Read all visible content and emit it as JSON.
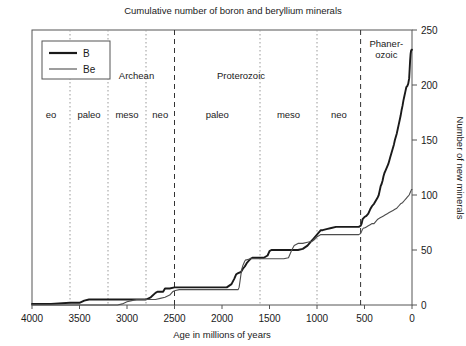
{
  "chart_data": {
    "type": "line",
    "title": "Cumulative number of boron and beryllium minerals",
    "xlabel": "Age in millions of years",
    "ylabel": "Number of new minerals",
    "xlim": [
      4000,
      0
    ],
    "ylim": [
      0,
      250
    ],
    "xticks": [
      4000,
      3500,
      3000,
      2500,
      2000,
      1500,
      1000,
      500,
      0
    ],
    "yticks": [
      0,
      50,
      100,
      150,
      200,
      250
    ],
    "xtick_labels": [
      "4000",
      "3500",
      "3000",
      "2500",
      "2000",
      "1500",
      "1000",
      "500",
      "0"
    ],
    "ytick_labels": [
      "0",
      "50",
      "100",
      "150",
      "200",
      "250"
    ],
    "x_axis_reversed": true,
    "grid": false,
    "legend_position": "top-left",
    "series": [
      {
        "name": "B",
        "color": "#1a1a1a",
        "width": 1.9,
        "points": [
          [
            4000,
            1
          ],
          [
            3800,
            1
          ],
          [
            3600,
            2
          ],
          [
            3500,
            2
          ],
          [
            3450,
            4
          ],
          [
            3400,
            5
          ],
          [
            3300,
            5
          ],
          [
            3200,
            5
          ],
          [
            3100,
            5
          ],
          [
            3000,
            5
          ],
          [
            2850,
            5
          ],
          [
            2800,
            5
          ],
          [
            2750,
            7
          ],
          [
            2700,
            11
          ],
          [
            2680,
            12
          ],
          [
            2620,
            12
          ],
          [
            2600,
            15
          ],
          [
            2550,
            15
          ],
          [
            2500,
            16
          ],
          [
            2400,
            16
          ],
          [
            2300,
            16
          ],
          [
            2200,
            16
          ],
          [
            2100,
            16
          ],
          [
            2000,
            16
          ],
          [
            1950,
            16
          ],
          [
            1900,
            19
          ],
          [
            1870,
            24
          ],
          [
            1850,
            28
          ],
          [
            1830,
            29
          ],
          [
            1800,
            30
          ],
          [
            1780,
            33
          ],
          [
            1760,
            35
          ],
          [
            1740,
            38
          ],
          [
            1720,
            40
          ],
          [
            1700,
            42
          ],
          [
            1680,
            43
          ],
          [
            1660,
            43
          ],
          [
            1640,
            43
          ],
          [
            1620,
            43
          ],
          [
            1600,
            43
          ],
          [
            1560,
            43
          ],
          [
            1520,
            45
          ],
          [
            1500,
            49
          ],
          [
            1480,
            50
          ],
          [
            1450,
            50
          ],
          [
            1400,
            50
          ],
          [
            1350,
            50
          ],
          [
            1300,
            50
          ],
          [
            1250,
            50
          ],
          [
            1200,
            50
          ],
          [
            1150,
            51
          ],
          [
            1100,
            54
          ],
          [
            1080,
            56
          ],
          [
            1060,
            58
          ],
          [
            1040,
            60
          ],
          [
            1020,
            62
          ],
          [
            1000,
            64
          ],
          [
            980,
            66
          ],
          [
            960,
            68
          ],
          [
            940,
            68
          ],
          [
            900,
            69
          ],
          [
            850,
            70
          ],
          [
            800,
            71
          ],
          [
            750,
            71
          ],
          [
            700,
            71
          ],
          [
            650,
            71
          ],
          [
            600,
            71
          ],
          [
            560,
            71
          ],
          [
            541,
            72
          ],
          [
            530,
            74
          ],
          [
            520,
            78
          ],
          [
            510,
            79
          ],
          [
            500,
            80
          ],
          [
            480,
            81
          ],
          [
            460,
            83
          ],
          [
            440,
            87
          ],
          [
            420,
            90
          ],
          [
            400,
            92
          ],
          [
            380,
            95
          ],
          [
            360,
            98
          ],
          [
            350,
            100
          ],
          [
            340,
            104
          ],
          [
            330,
            108
          ],
          [
            320,
            110
          ],
          [
            310,
            113
          ],
          [
            300,
            117
          ],
          [
            290,
            120
          ],
          [
            280,
            122
          ],
          [
            270,
            124
          ],
          [
            260,
            126
          ],
          [
            250,
            128
          ],
          [
            240,
            131
          ],
          [
            230,
            134
          ],
          [
            220,
            137
          ],
          [
            210,
            140
          ],
          [
            200,
            143
          ],
          [
            190,
            146
          ],
          [
            180,
            150
          ],
          [
            170,
            153
          ],
          [
            160,
            156
          ],
          [
            150,
            160
          ],
          [
            140,
            164
          ],
          [
            130,
            168
          ],
          [
            120,
            172
          ],
          [
            110,
            177
          ],
          [
            100,
            181
          ],
          [
            90,
            186
          ],
          [
            80,
            190
          ],
          [
            70,
            194
          ],
          [
            60,
            198
          ],
          [
            50,
            199
          ],
          [
            40,
            201
          ],
          [
            30,
            206
          ],
          [
            25,
            214
          ],
          [
            20,
            222
          ],
          [
            15,
            228
          ],
          [
            10,
            231
          ],
          [
            5,
            232
          ],
          [
            0,
            232
          ]
        ]
      },
      {
        "name": "Be",
        "color": "#4d4d4d",
        "width": 1.1,
        "points": [
          [
            4000,
            0
          ],
          [
            3600,
            0
          ],
          [
            3400,
            0
          ],
          [
            3200,
            0
          ],
          [
            3100,
            0
          ],
          [
            3050,
            1
          ],
          [
            3000,
            3
          ],
          [
            2950,
            4
          ],
          [
            2900,
            5
          ],
          [
            2850,
            5
          ],
          [
            2800,
            5
          ],
          [
            2750,
            5
          ],
          [
            2700,
            5
          ],
          [
            2650,
            6
          ],
          [
            2600,
            7
          ],
          [
            2550,
            9
          ],
          [
            2520,
            12
          ],
          [
            2500,
            13
          ],
          [
            2450,
            14
          ],
          [
            2400,
            14
          ],
          [
            2300,
            14
          ],
          [
            2200,
            14
          ],
          [
            2100,
            14
          ],
          [
            2000,
            14
          ],
          [
            1950,
            14
          ],
          [
            1900,
            14
          ],
          [
            1870,
            14
          ],
          [
            1850,
            14
          ],
          [
            1830,
            14
          ],
          [
            1820,
            16
          ],
          [
            1810,
            22
          ],
          [
            1800,
            28
          ],
          [
            1790,
            33
          ],
          [
            1780,
            36
          ],
          [
            1770,
            38
          ],
          [
            1760,
            40
          ],
          [
            1750,
            41
          ],
          [
            1740,
            41
          ],
          [
            1700,
            42
          ],
          [
            1650,
            42
          ],
          [
            1600,
            42
          ],
          [
            1550,
            42
          ],
          [
            1500,
            42
          ],
          [
            1450,
            42
          ],
          [
            1400,
            42
          ],
          [
            1350,
            42
          ],
          [
            1300,
            43
          ],
          [
            1280,
            47
          ],
          [
            1260,
            51
          ],
          [
            1240,
            54
          ],
          [
            1220,
            55
          ],
          [
            1200,
            56
          ],
          [
            1150,
            56
          ],
          [
            1100,
            57
          ],
          [
            1050,
            58
          ],
          [
            1020,
            60
          ],
          [
            1000,
            62
          ],
          [
            980,
            63
          ],
          [
            960,
            64
          ],
          [
            940,
            64
          ],
          [
            900,
            64
          ],
          [
            850,
            64
          ],
          [
            800,
            64
          ],
          [
            750,
            64
          ],
          [
            700,
            64
          ],
          [
            650,
            64
          ],
          [
            600,
            64
          ],
          [
            560,
            64
          ],
          [
            541,
            65
          ],
          [
            530,
            67
          ],
          [
            520,
            69
          ],
          [
            510,
            70
          ],
          [
            500,
            70
          ],
          [
            480,
            71
          ],
          [
            460,
            72
          ],
          [
            440,
            73
          ],
          [
            420,
            74
          ],
          [
            400,
            74
          ],
          [
            380,
            76
          ],
          [
            360,
            78
          ],
          [
            340,
            79
          ],
          [
            320,
            80
          ],
          [
            300,
            81
          ],
          [
            280,
            82
          ],
          [
            260,
            83
          ],
          [
            240,
            84
          ],
          [
            220,
            85
          ],
          [
            200,
            86
          ],
          [
            180,
            87
          ],
          [
            160,
            88
          ],
          [
            140,
            90
          ],
          [
            120,
            92
          ],
          [
            100,
            93
          ],
          [
            90,
            94
          ],
          [
            80,
            95
          ],
          [
            70,
            96
          ],
          [
            60,
            97
          ],
          [
            50,
            98
          ],
          [
            40,
            99
          ],
          [
            30,
            100
          ],
          [
            20,
            102
          ],
          [
            10,
            104
          ],
          [
            5,
            105
          ],
          [
            0,
            105
          ]
        ]
      }
    ],
    "eon_labels": [
      {
        "text": "Archean",
        "x": 2900
      },
      {
        "text": "Proterozoic",
        "x": 1800
      },
      {
        "text": "Phaner-",
        "x": 270
      },
      {
        "text": "ozoic",
        "x": 270
      }
    ],
    "era_labels": [
      {
        "text": "eo",
        "x": 3800
      },
      {
        "text": "paleo",
        "x": 3400
      },
      {
        "text": "meso",
        "x": 3000
      },
      {
        "text": "neo",
        "x": 2650
      },
      {
        "text": "paleo",
        "x": 2050
      },
      {
        "text": "meso",
        "x": 1300
      },
      {
        "text": "neo",
        "x": 770
      }
    ],
    "dividers": [
      {
        "x": 3600,
        "style": "dotted"
      },
      {
        "x": 3200,
        "style": "dotted"
      },
      {
        "x": 2800,
        "style": "dotted"
      },
      {
        "x": 2500,
        "style": "dashed"
      },
      {
        "x": 1600,
        "style": "dotted"
      },
      {
        "x": 1000,
        "style": "dotted"
      },
      {
        "x": 541,
        "style": "dashed"
      }
    ],
    "legend": [
      {
        "label": "B",
        "color": "#1a1a1a",
        "width": 2.2
      },
      {
        "label": "Be",
        "color": "#4d4d4d",
        "width": 1.1
      }
    ]
  }
}
